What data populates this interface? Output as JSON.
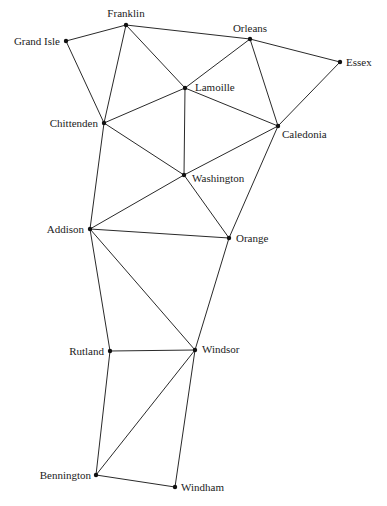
{
  "diagram": {
    "type": "graph",
    "nodes": [
      {
        "id": "franklin",
        "label": "Franklin",
        "x": 126,
        "y": 25,
        "lx": 126,
        "ly": 17,
        "anchor": "middle"
      },
      {
        "id": "grand-isle",
        "label": "Grand Isle",
        "x": 66,
        "y": 41,
        "lx": 60,
        "ly": 45,
        "anchor": "end"
      },
      {
        "id": "orleans",
        "label": "Orleans",
        "x": 250,
        "y": 39,
        "lx": 250,
        "ly": 32,
        "anchor": "middle"
      },
      {
        "id": "essex",
        "label": "Essex",
        "x": 340,
        "y": 62,
        "lx": 346,
        "ly": 66,
        "anchor": "start"
      },
      {
        "id": "lamoille",
        "label": "Lamoille",
        "x": 185,
        "y": 88,
        "lx": 195,
        "ly": 91,
        "anchor": "start"
      },
      {
        "id": "chittenden",
        "label": "Chittenden",
        "x": 104,
        "y": 123,
        "lx": 98,
        "ly": 127,
        "anchor": "end"
      },
      {
        "id": "caledonia",
        "label": "Caledonia",
        "x": 278,
        "y": 126,
        "lx": 282,
        "ly": 138,
        "anchor": "start"
      },
      {
        "id": "washington",
        "label": "Washington",
        "x": 184,
        "y": 175,
        "lx": 192,
        "ly": 182,
        "anchor": "start"
      },
      {
        "id": "addison",
        "label": "Addison",
        "x": 90,
        "y": 229,
        "lx": 84,
        "ly": 233,
        "anchor": "end"
      },
      {
        "id": "orange",
        "label": "Orange",
        "x": 229,
        "y": 238,
        "lx": 236,
        "ly": 242,
        "anchor": "start"
      },
      {
        "id": "rutland",
        "label": "Rutland",
        "x": 110,
        "y": 351,
        "lx": 104,
        "ly": 355,
        "anchor": "end"
      },
      {
        "id": "windsor",
        "label": "Windsor",
        "x": 195,
        "y": 350,
        "lx": 202,
        "ly": 353,
        "anchor": "start"
      },
      {
        "id": "bennington",
        "label": "Bennington",
        "x": 96,
        "y": 475,
        "lx": 91,
        "ly": 479,
        "anchor": "end"
      },
      {
        "id": "windham",
        "label": "Windham",
        "x": 175,
        "y": 487,
        "lx": 181,
        "ly": 491,
        "anchor": "start"
      }
    ],
    "edges": [
      [
        "franklin",
        "grand-isle"
      ],
      [
        "franklin",
        "orleans"
      ],
      [
        "franklin",
        "chittenden"
      ],
      [
        "franklin",
        "lamoille"
      ],
      [
        "grand-isle",
        "chittenden"
      ],
      [
        "orleans",
        "lamoille"
      ],
      [
        "orleans",
        "essex"
      ],
      [
        "orleans",
        "caledonia"
      ],
      [
        "essex",
        "caledonia"
      ],
      [
        "lamoille",
        "chittenden"
      ],
      [
        "lamoille",
        "caledonia"
      ],
      [
        "lamoille",
        "washington"
      ],
      [
        "chittenden",
        "washington"
      ],
      [
        "chittenden",
        "addison"
      ],
      [
        "caledonia",
        "washington"
      ],
      [
        "caledonia",
        "orange"
      ],
      [
        "washington",
        "addison"
      ],
      [
        "washington",
        "orange"
      ],
      [
        "addison",
        "orange"
      ],
      [
        "addison",
        "rutland"
      ],
      [
        "addison",
        "windsor"
      ],
      [
        "orange",
        "windsor"
      ],
      [
        "rutland",
        "windsor"
      ],
      [
        "rutland",
        "bennington"
      ],
      [
        "windsor",
        "bennington"
      ],
      [
        "windsor",
        "windham"
      ],
      [
        "bennington",
        "windham"
      ]
    ]
  }
}
